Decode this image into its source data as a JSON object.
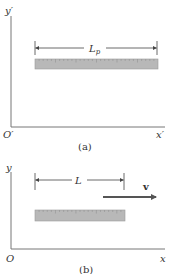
{
  "panel_a": {
    "caption": "(a)",
    "y_axis_label": "y′",
    "x_axis_label": "x′",
    "origin_label": "O′",
    "length_label": "L",
    "length_subscript": "p",
    "ruler": {
      "fill": "#b8b8b8",
      "ticks": 30
    }
  },
  "panel_b": {
    "caption": "(b)",
    "y_axis_label": "y",
    "x_axis_label": "x",
    "origin_label": "O",
    "length_label": "L",
    "velocity_label": "v",
    "ruler": {
      "fill": "#b8b8b8",
      "ticks": 22
    }
  },
  "colors": {
    "axis": "#777777",
    "ruler_fill": "#b8b8b8",
    "ruler_edge": "#9a9a9a",
    "velocity_arrow": "#555555",
    "text": "#333333"
  }
}
